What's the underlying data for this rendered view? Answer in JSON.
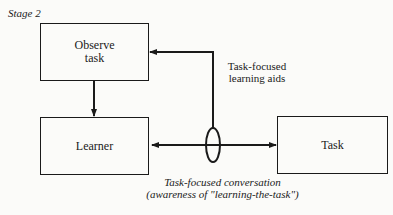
{
  "stage_label": "Stage 2",
  "nodes": {
    "observe_task": {
      "line1": "Observe",
      "line2": "task"
    },
    "learner": {
      "label": "Learner"
    },
    "task": {
      "label": "Task"
    }
  },
  "edges": {
    "learning_aids": {
      "line1": "Task-focused",
      "line2": "learning aids"
    },
    "conversation": {
      "line1": "Task-focused conversation",
      "line2": "(awareness of \"learning-the-task\")"
    }
  }
}
